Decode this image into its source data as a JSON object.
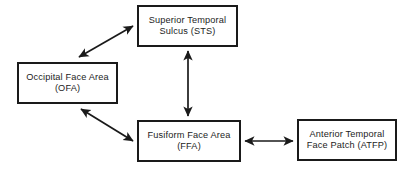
{
  "diagram": {
    "background_color": "#ffffff",
    "node_border_color": "#1a1a1a",
    "arrow_color": "#1a1a1a",
    "nodes": [
      {
        "id": "sts",
        "label_line1": "Superior Temporal",
        "label_line2": "Sulcus (STS)",
        "abbreviation": "STS",
        "full_name": "Superior Temporal Sulcus"
      },
      {
        "id": "ofa",
        "label_line1": "Occipital Face Area",
        "label_line2": "(OFA)",
        "abbreviation": "OFA",
        "full_name": "Occipital Face Area"
      },
      {
        "id": "ffa",
        "label_line1": "Fusiform Face Area",
        "label_line2": "(FFA)",
        "abbreviation": "FFA",
        "full_name": "Fusiform Face Area"
      },
      {
        "id": "atfp",
        "label_line1": "Anterior Temporal",
        "label_line2": "Face Patch (ATFP)",
        "abbreviation": "ATFP",
        "full_name": "Anterior Temporal Face Patch"
      }
    ],
    "edges": [
      {
        "id": "ofa-sts",
        "from": "OFA",
        "to": "STS",
        "direction": "bidirectional",
        "style": "diagonal"
      },
      {
        "id": "sts-ffa",
        "from": "STS",
        "to": "FFA",
        "direction": "bidirectional",
        "style": "vertical"
      },
      {
        "id": "ofa-ffa",
        "from": "OFA",
        "to": "FFA",
        "direction": "bidirectional",
        "style": "diagonal"
      },
      {
        "id": "ffa-atfp",
        "from": "FFA",
        "to": "ATFP",
        "direction": "bidirectional",
        "style": "horizontal"
      }
    ]
  }
}
